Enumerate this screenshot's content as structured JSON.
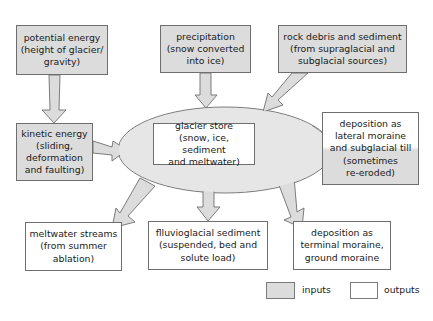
{
  "colors": {
    "input_fill": "#dcdcdc",
    "output_fill": "#ffffff",
    "store_fill": "#e6e6e6",
    "stroke": "#6e6e6e"
  },
  "nodes": {
    "potential_energy": {
      "type": "input",
      "lines": [
        "potential energy",
        "(height of glacier/",
        "gravity)"
      ]
    },
    "precipitation": {
      "type": "input",
      "lines": [
        "precipitation",
        "(snow converted",
        "into ice)"
      ]
    },
    "rock_debris": {
      "type": "input",
      "lines": [
        "rock debris and sediment",
        "(from supraglacial and",
        "subglacial sources)"
      ]
    },
    "kinetic_energy": {
      "type": "input",
      "lines": [
        "kinetic energy",
        "(sliding,",
        "deformation",
        "and faulting)"
      ]
    },
    "glacier_store": {
      "type": "store",
      "lines": [
        "glacier store",
        "(snow, ice, sediment",
        "and meltwater)"
      ]
    },
    "lateral_moraine": {
      "type": "output-and-input",
      "lines": [
        "deposition as",
        "lateral moraine",
        "and subglacial till",
        "(sometimes",
        "re-eroded)"
      ]
    },
    "meltwater_streams": {
      "type": "output",
      "lines": [
        "meltwater streams",
        "(from summer",
        "ablation)"
      ]
    },
    "fluvioglacial_sediment": {
      "type": "output",
      "lines": [
        "flluvioglacial sediment",
        "(suspended, bed and",
        "solute load)"
      ]
    },
    "terminal_moraine": {
      "type": "output",
      "lines": [
        "deposition as",
        "terminal moraine,",
        "ground moraine"
      ]
    }
  },
  "edges": [
    {
      "from": "potential_energy",
      "to": "kinetic_energy"
    },
    {
      "from": "precipitation",
      "to": "glacier_store"
    },
    {
      "from": "rock_debris",
      "to": "glacier_store"
    },
    {
      "from": "kinetic_energy",
      "to": "glacier_store"
    },
    {
      "from": "glacier_store",
      "to": "lateral_moraine"
    },
    {
      "from": "lateral_moraine",
      "to": "glacier_store"
    },
    {
      "from": "glacier_store",
      "to": "meltwater_streams"
    },
    {
      "from": "glacier_store",
      "to": "fluvioglacial_sediment"
    },
    {
      "from": "glacier_store",
      "to": "terminal_moraine"
    }
  ],
  "legend": {
    "inputs_label": "inputs",
    "outputs_label": "outputs"
  }
}
